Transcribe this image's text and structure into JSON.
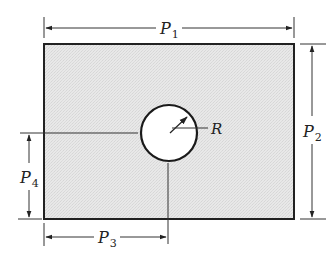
{
  "diagram": {
    "labels": {
      "p1": {
        "symbol": "P",
        "subscript": "1"
      },
      "p2": {
        "symbol": "P",
        "subscript": "2"
      },
      "p3": {
        "symbol": "P",
        "subscript": "3"
      },
      "p4": {
        "symbol": "P",
        "subscript": "4"
      },
      "radius": "R"
    },
    "colors": {
      "plate_fill": "#e6e6e6",
      "hole_fill": "#ffffff",
      "stroke": "#222222",
      "dimension": "#333333"
    }
  }
}
